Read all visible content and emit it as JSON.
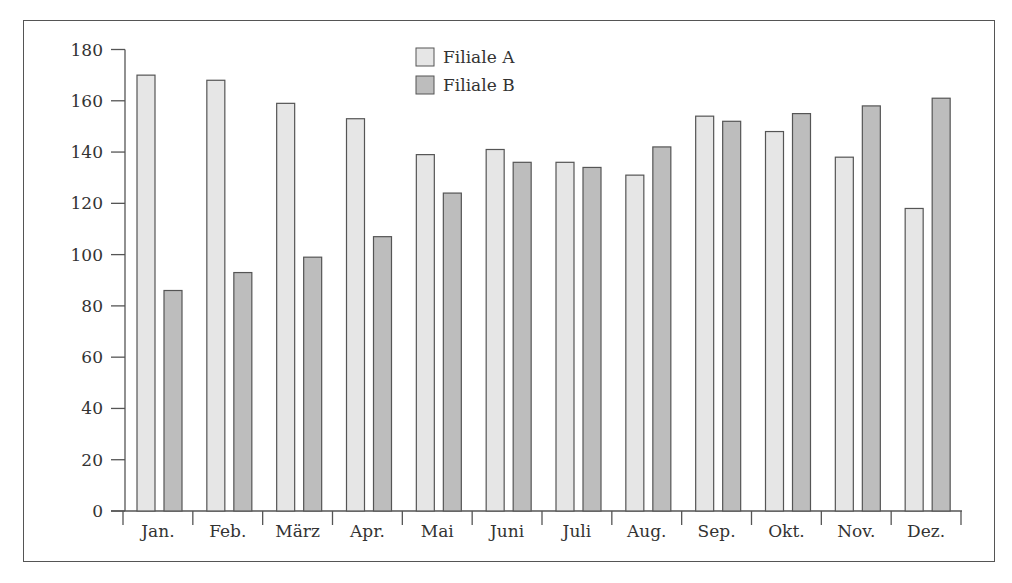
{
  "chart_data": {
    "type": "bar",
    "title": "",
    "xlabel": "",
    "ylabel": "",
    "ylim": [
      0,
      180
    ],
    "yticks": [
      0,
      20,
      40,
      60,
      80,
      100,
      120,
      140,
      160,
      180
    ],
    "grid": false,
    "legend_position": "top-center",
    "categories": [
      "Jan.",
      "Feb.",
      "März",
      "Apr.",
      "Mai",
      "Juni",
      "Juli",
      "Aug.",
      "Sep.",
      "Okt.",
      "Nov.",
      "Dez."
    ],
    "series": [
      {
        "name": "Filiale A",
        "color": "#e6e6e6",
        "values": [
          170,
          168,
          159,
          153,
          139,
          141,
          136,
          131,
          154,
          148,
          138,
          118
        ]
      },
      {
        "name": "Filiale B",
        "color": "#bdbdbd",
        "values": [
          86,
          93,
          99,
          107,
          124,
          136,
          134,
          142,
          152,
          155,
          158,
          161
        ]
      }
    ]
  },
  "style": {
    "stroke": "#555555",
    "text": "#333333"
  }
}
